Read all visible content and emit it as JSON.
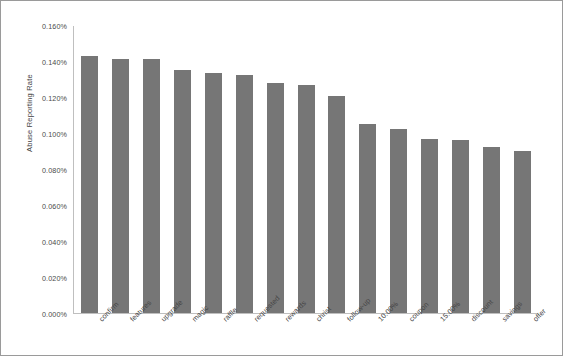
{
  "chart_data": {
    "type": "bar",
    "title": "",
    "xlabel": "",
    "ylabel": "Abuse Reporting Rate",
    "ylim": [
      0,
      0.0016
    ],
    "grid": false,
    "legend": null,
    "bar_color": "#767676",
    "value_suffix": "%",
    "ytick_labels": [
      "0.160%",
      "0.140%",
      "0.120%",
      "0.100%",
      "0.080%",
      "0.060%",
      "0.040%",
      "0.020%",
      "0.000%"
    ],
    "ytick_values": [
      0.16,
      0.14,
      0.12,
      0.1,
      0.08,
      0.06,
      0.04,
      0.02,
      0.0
    ],
    "categories": [
      "confirm",
      "features",
      "upgrade",
      "magic",
      "raffle",
      "requested",
      "rewards",
      "christ",
      "follow-up",
      "10.00%",
      "coupon",
      "15.00%",
      "discount",
      "savings",
      "offer"
    ],
    "values": [
      0.143,
      0.1412,
      0.1411,
      0.135,
      0.1335,
      0.1325,
      0.128,
      0.1265,
      0.1205,
      0.105,
      0.1025,
      0.0965,
      0.096,
      0.0925,
      0.09
    ]
  }
}
